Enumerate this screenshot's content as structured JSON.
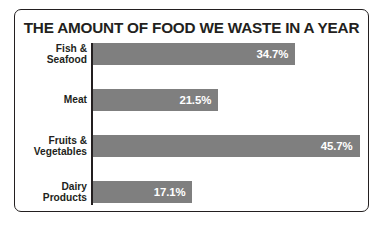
{
  "chart_data": {
    "type": "bar",
    "orientation": "horizontal",
    "title": "THE AMOUNT OF FOOD WE WASTE IN A YEAR",
    "xlabel": "",
    "ylabel": "",
    "grid": false,
    "legend": false,
    "value_suffix": "%",
    "xlim": [
      0,
      45.7
    ],
    "axis_line": true,
    "bar_color": "#7f7f7f",
    "value_label_color": "#ffffff",
    "text_color": "#231f20",
    "categories": [
      "Fish &\nSeafood",
      "Meat",
      "Fruits &\nVegetables",
      "Dairy\nProducts"
    ],
    "values": [
      34.7,
      21.5,
      45.7,
      17.1
    ],
    "value_labels": [
      "34.7%",
      "21.5%",
      "45.7%",
      "17.1%"
    ]
  }
}
